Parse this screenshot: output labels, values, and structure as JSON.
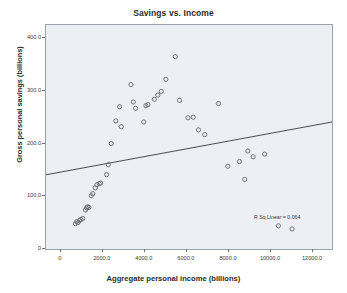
{
  "chart_data": {
    "type": "scatter",
    "title": "Savings vs. Income",
    "xlabel": "Aggregate personal income (billions)",
    "ylabel": "Gross personal savings (billions)",
    "xlim": [
      -700,
      12900
    ],
    "ylim": [
      0,
      425
    ],
    "grid": false,
    "legend": null,
    "xticks": [
      0,
      2000,
      4000,
      6000,
      8000,
      10000,
      12000
    ],
    "xtick_labels": [
      "0",
      "2000.0",
      "4000.0",
      "6000.0",
      "8000.0",
      "10000.0",
      "12000.0"
    ],
    "yticks": [
      0,
      100,
      200,
      300,
      400
    ],
    "ytick_labels": [
      "0",
      "100.0",
      "200.0",
      "300.0",
      "400.0"
    ],
    "annotation": "R Sq Linear = 0.064",
    "fit_line": {
      "type": "linear",
      "x_start": -700,
      "y_start": 141,
      "x_end": 12900,
      "y_end": 241
    },
    "points": [
      {
        "x": 700,
        "y": 48
      },
      {
        "x": 760,
        "y": 52
      },
      {
        "x": 820,
        "y": 50
      },
      {
        "x": 900,
        "y": 54
      },
      {
        "x": 960,
        "y": 56
      },
      {
        "x": 1050,
        "y": 58
      },
      {
        "x": 1180,
        "y": 74
      },
      {
        "x": 1230,
        "y": 78
      },
      {
        "x": 1280,
        "y": 80
      },
      {
        "x": 1340,
        "y": 79
      },
      {
        "x": 1450,
        "y": 101
      },
      {
        "x": 1520,
        "y": 105
      },
      {
        "x": 1640,
        "y": 116
      },
      {
        "x": 1720,
        "y": 122
      },
      {
        "x": 1830,
        "y": 124
      },
      {
        "x": 1900,
        "y": 125
      },
      {
        "x": 2180,
        "y": 141
      },
      {
        "x": 2260,
        "y": 160
      },
      {
        "x": 2400,
        "y": 200
      },
      {
        "x": 2620,
        "y": 243
      },
      {
        "x": 2800,
        "y": 270
      },
      {
        "x": 2880,
        "y": 232
      },
      {
        "x": 3340,
        "y": 312
      },
      {
        "x": 3450,
        "y": 279
      },
      {
        "x": 3560,
        "y": 267
      },
      {
        "x": 3950,
        "y": 241
      },
      {
        "x": 4050,
        "y": 272
      },
      {
        "x": 4150,
        "y": 274
      },
      {
        "x": 4450,
        "y": 284
      },
      {
        "x": 4620,
        "y": 292
      },
      {
        "x": 4780,
        "y": 299
      },
      {
        "x": 5000,
        "y": 322
      },
      {
        "x": 5450,
        "y": 365
      },
      {
        "x": 5650,
        "y": 282
      },
      {
        "x": 6050,
        "y": 249
      },
      {
        "x": 6300,
        "y": 250
      },
      {
        "x": 6550,
        "y": 226
      },
      {
        "x": 6850,
        "y": 217
      },
      {
        "x": 7500,
        "y": 276
      },
      {
        "x": 7950,
        "y": 157
      },
      {
        "x": 8500,
        "y": 166
      },
      {
        "x": 8750,
        "y": 132
      },
      {
        "x": 8900,
        "y": 186
      },
      {
        "x": 9150,
        "y": 175
      },
      {
        "x": 9700,
        "y": 180
      },
      {
        "x": 10350,
        "y": 44
      },
      {
        "x": 11000,
        "y": 38
      }
    ]
  }
}
